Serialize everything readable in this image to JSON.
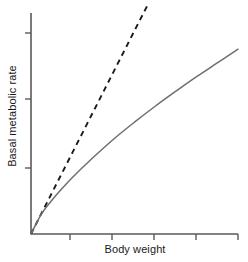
{
  "figure": {
    "title": "",
    "background_color": "#ffffff",
    "width": 248,
    "height": 262
  },
  "axes": {
    "y_label": "Basal metabolic rate",
    "x_label": "Body weight",
    "axis_color": "#595959",
    "origin": {
      "x": 31,
      "y": 234
    },
    "y_axis_top": 13,
    "x_axis_right": 238,
    "y_ticks": [
      33,
      99,
      168
    ],
    "x_ticks": [
      70,
      112,
      154,
      196,
      238
    ],
    "tick_length": 6,
    "tick_labels_shown": false
  },
  "chart_data": {
    "type": "line",
    "title": "",
    "xlabel": "Body weight",
    "ylabel": "Basal metabolic rate",
    "xlim": [
      0,
      5
    ],
    "ylim": [
      0,
      5
    ],
    "grid": false,
    "legend": "none",
    "x_tick_labels": [],
    "y_tick_labels": [],
    "series": [
      {
        "name": "isometric-reference",
        "style": "dashed",
        "color": "#1a1a1a",
        "description": "Straight dashed line of direct proportionality rising steeply from the origin",
        "x": [
          0.0,
          0.5,
          1.0,
          1.5,
          2.0,
          2.5,
          2.8
        ],
        "y": [
          0.0,
          0.92,
          1.84,
          2.76,
          3.68,
          4.6,
          5.15
        ]
      },
      {
        "name": "allometric-curve",
        "style": "solid",
        "color": "#6e6e6e",
        "description": "Concave-down curve (power law, exponent about 0.75) rising from the origin and flattening toward the right",
        "x": [
          0.0,
          0.25,
          0.5,
          0.75,
          1.0,
          1.5,
          2.0,
          2.5,
          3.0,
          3.5,
          4.0,
          4.5,
          5.0
        ],
        "y": [
          0.0,
          0.45,
          0.76,
          1.03,
          1.28,
          1.73,
          2.15,
          2.53,
          2.89,
          3.23,
          3.56,
          3.87,
          4.18
        ]
      }
    ],
    "annotations": []
  }
}
